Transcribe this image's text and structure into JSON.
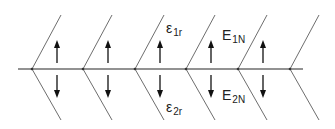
{
  "diagram": {
    "type": "layered-interface-field-diagram",
    "colors": {
      "line": "#6e6e6e",
      "arrow": "#111111",
      "text": "#222222",
      "background": "#ffffff"
    },
    "baseline": {
      "y": 69,
      "x_start": 18,
      "x_end": 303
    },
    "chevrons": [
      {
        "vertex_x": 32
      },
      {
        "vertex_x": 83
      },
      {
        "vertex_x": 135
      },
      {
        "vertex_x": 186
      },
      {
        "vertex_x": 238
      },
      {
        "vertex_x": 290
      }
    ],
    "arrows": [
      {
        "x": 57
      },
      {
        "x": 108
      },
      {
        "x": 160
      },
      {
        "x": 211
      },
      {
        "x": 263
      }
    ],
    "labels": {
      "eps1r": {
        "base": "ε",
        "sub": "1r"
      },
      "eps2r": {
        "base": "ε",
        "sub": "2r"
      },
      "e1n": {
        "base": "E",
        "sub": "1N"
      },
      "e2n": {
        "base": "E",
        "sub": "2N"
      }
    }
  }
}
